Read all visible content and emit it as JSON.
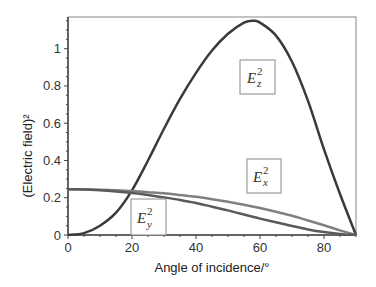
{
  "chart_data": {
    "type": "line",
    "title": "",
    "xlabel": "Angle of incidence/°",
    "ylabel": "(Electric field)²",
    "xlim": [
      0,
      90
    ],
    "ylim": [
      0,
      1.17
    ],
    "x_ticks": [
      0,
      20,
      40,
      60,
      80
    ],
    "x_tick_labels": [
      "0",
      "20",
      "40",
      "60",
      "80"
    ],
    "y_ticks": [
      0,
      0.2,
      0.4,
      0.6,
      0.8,
      1
    ],
    "y_tick_labels": [
      "0",
      "0.2",
      "0.4",
      "0.6",
      "0.8",
      "1"
    ],
    "grid": false,
    "legend_position": "inline boxed labels",
    "x": [
      0,
      5,
      10,
      15,
      20,
      25,
      30,
      35,
      40,
      45,
      50,
      55,
      58,
      60,
      65,
      70,
      75,
      80,
      85,
      90
    ],
    "series": [
      {
        "name": "Ez²",
        "label_base": "E",
        "label_sub": "z",
        "label_sup": "2",
        "color": "#3a3a3a",
        "values": [
          0.0,
          0.01,
          0.05,
          0.12,
          0.24,
          0.4,
          0.57,
          0.73,
          0.87,
          0.99,
          1.08,
          1.14,
          1.15,
          1.14,
          1.07,
          0.93,
          0.72,
          0.46,
          0.22,
          0.0
        ]
      },
      {
        "name": "Ex²",
        "label_base": "E",
        "label_sub": "x",
        "label_sup": "2",
        "color": "#808080",
        "values": [
          0.245,
          0.245,
          0.243,
          0.24,
          0.236,
          0.23,
          0.224,
          0.215,
          0.205,
          0.192,
          0.178,
          0.162,
          0.152,
          0.145,
          0.125,
          0.103,
          0.078,
          0.052,
          0.025,
          0.0
        ]
      },
      {
        "name": "Ey²",
        "label_base": "E",
        "label_sub": "y",
        "label_sup": "2",
        "color": "#5a5a5a",
        "values": [
          0.245,
          0.244,
          0.24,
          0.234,
          0.226,
          0.215,
          0.202,
          0.188,
          0.172,
          0.152,
          0.132,
          0.11,
          0.097,
          0.088,
          0.068,
          0.048,
          0.03,
          0.016,
          0.006,
          0.0
        ]
      }
    ]
  },
  "labels": {
    "ez": {
      "base": "E",
      "sub": "z",
      "sup": "2"
    },
    "ex": {
      "base": "E",
      "sub": "x",
      "sup": "2"
    },
    "ey": {
      "base": "E",
      "sub": "y",
      "sup": "2"
    }
  }
}
